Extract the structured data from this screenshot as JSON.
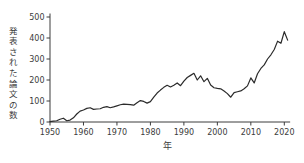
{
  "figure": {
    "background": "#ffffff",
    "line_color": "#2b2b2b",
    "axis_color": "#3c3c3c",
    "text_color": "#3c3c3c"
  },
  "chart_data": {
    "type": "line",
    "title": "",
    "xlabel": "年",
    "ylabel": "発表された論文の数",
    "ylim": [
      0,
      500
    ],
    "xlim": [
      1950,
      2021
    ],
    "grid": false,
    "legend_position": "none",
    "x_ticks": [
      1950,
      1960,
      1970,
      1980,
      1990,
      2000,
      2010,
      2020
    ],
    "y_ticks": [
      0,
      100,
      200,
      300,
      400,
      500
    ],
    "x": [
      1950,
      1951,
      1952,
      1953,
      1954,
      1955,
      1956,
      1957,
      1958,
      1959,
      1960,
      1961,
      1962,
      1963,
      1964,
      1965,
      1966,
      1967,
      1968,
      1969,
      1970,
      1971,
      1972,
      1973,
      1974,
      1975,
      1976,
      1977,
      1978,
      1979,
      1980,
      1981,
      1982,
      1983,
      1984,
      1985,
      1986,
      1987,
      1988,
      1989,
      1990,
      1991,
      1992,
      1993,
      1994,
      1995,
      1996,
      1997,
      1998,
      1999,
      2000,
      2001,
      2002,
      2003,
      2004,
      2005,
      2006,
      2007,
      2008,
      2009,
      2010,
      2011,
      2012,
      2013,
      2014,
      2015,
      2016,
      2017,
      2018,
      2019,
      2020,
      2021
    ],
    "values": [
      2,
      4,
      6,
      13,
      18,
      6,
      9,
      20,
      38,
      52,
      57,
      65,
      68,
      60,
      62,
      63,
      70,
      73,
      68,
      72,
      77,
      82,
      85,
      84,
      83,
      80,
      92,
      102,
      98,
      90,
      97,
      118,
      138,
      152,
      165,
      175,
      167,
      175,
      186,
      173,
      195,
      212,
      222,
      232,
      200,
      220,
      192,
      208,
      176,
      163,
      160,
      158,
      148,
      135,
      118,
      140,
      144,
      148,
      158,
      172,
      210,
      186,
      230,
      255,
      272,
      300,
      320,
      345,
      385,
      375,
      430,
      390
    ]
  }
}
